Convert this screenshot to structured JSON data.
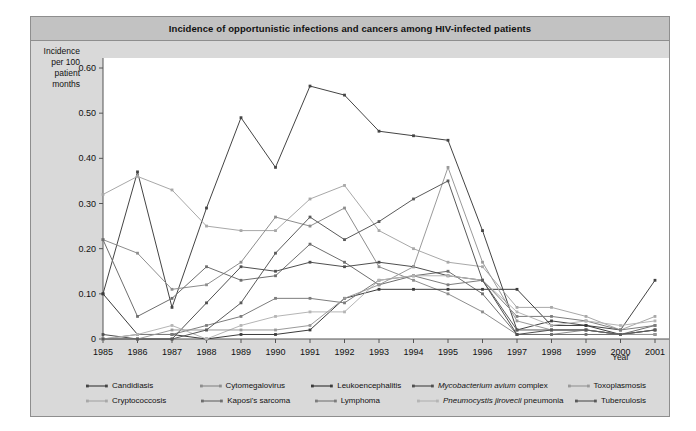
{
  "figure": {
    "title": "Incidence of opportunistic infections and cancers among HIV-infected patients",
    "ylabel_lines": [
      "Incidence",
      "per 100",
      "patient",
      "months"
    ],
    "xlabel": "Year",
    "panel_bg": "#d9d9d9",
    "title_bg": "#c2c2c2",
    "plot_bg": "#ffffff"
  },
  "chart_data": {
    "type": "line",
    "title": "Incidence of opportunistic infections and cancers among HIV-infected patients",
    "xlabel": "Year",
    "ylabel": "Incidence per 100 patient months",
    "x": [
      1985,
      1986,
      1987,
      1988,
      1989,
      1990,
      1991,
      1992,
      1993,
      1994,
      1995,
      1996,
      1997,
      1998,
      1999,
      2000,
      2001
    ],
    "xtick_labels": [
      "1985",
      "1986",
      "1987",
      "1988",
      "1989",
      "1990",
      "1991",
      "1992",
      "1993",
      "1994",
      "1995",
      "1996",
      "1997",
      "1998",
      "1999",
      "2000",
      "2001"
    ],
    "ylim": [
      0,
      0.6
    ],
    "ytick_values": [
      0,
      0.1,
      0.2,
      0.3,
      0.4,
      0.5,
      0.6
    ],
    "ytick_labels": [
      "0",
      "0.10",
      "0.20",
      "0.30",
      "0.40",
      "0.50",
      "0.60"
    ],
    "grid": false,
    "legend_position": "bottom",
    "series": [
      {
        "name": "Candidiasis",
        "color": "#444444",
        "values": [
          0.1,
          0.37,
          0.07,
          0.29,
          0.49,
          0.38,
          0.56,
          0.54,
          0.46,
          0.45,
          0.44,
          0.24,
          0.02,
          0.04,
          0.03,
          0.02,
          0.13
        ]
      },
      {
        "name": "Cryptococcosis",
        "color": "#a8a8a8",
        "values": [
          0.32,
          0.36,
          0.33,
          0.25,
          0.24,
          0.24,
          0.31,
          0.34,
          0.24,
          0.2,
          0.17,
          0.16,
          0.07,
          0.07,
          0.05,
          0.02,
          0.05
        ]
      },
      {
        "name": "Cytomegalovirus",
        "color": "#8d8d8d",
        "values": [
          0.22,
          0.19,
          0.11,
          0.12,
          0.17,
          0.27,
          0.25,
          0.29,
          0.16,
          0.13,
          0.1,
          0.06,
          0.01,
          0.01,
          0.02,
          0.01,
          0.02
        ]
      },
      {
        "name": "Kaposi's sarcoma",
        "color": "#6e6e6e",
        "values": [
          0.22,
          0.05,
          0.09,
          0.16,
          0.13,
          0.14,
          0.21,
          0.17,
          0.12,
          0.14,
          0.15,
          0.1,
          0.01,
          0.01,
          0.01,
          0.01,
          0.03
        ]
      },
      {
        "name": "Leukoencephalitis",
        "color": "#3b3b3b",
        "values": [
          0.1,
          0.01,
          0.01,
          0.0,
          0.01,
          0.01,
          0.02,
          0.09,
          0.11,
          0.11,
          0.11,
          0.11,
          0.11,
          0.03,
          0.03,
          0.01,
          0.01
        ]
      },
      {
        "name": "Lymphoma",
        "color": "#7d7d7d",
        "values": [
          0.0,
          0.01,
          0.01,
          0.03,
          0.05,
          0.09,
          0.09,
          0.08,
          0.13,
          0.14,
          0.12,
          0.13,
          0.05,
          0.05,
          0.04,
          0.02,
          0.03
        ]
      },
      {
        "name": "Mycobacterium avium complex",
        "color": "#4f4f4f",
        "values": [
          0.01,
          0.0,
          0.0,
          0.08,
          0.16,
          0.15,
          0.17,
          0.16,
          0.17,
          0.16,
          0.14,
          0.13,
          0.01,
          0.02,
          0.02,
          0.01,
          0.02
        ]
      },
      {
        "name": "Pneumocystis jirovecii pneumonia",
        "color": "#b5b5b5",
        "values": [
          0.0,
          0.01,
          0.03,
          0.0,
          0.03,
          0.05,
          0.06,
          0.06,
          0.13,
          0.14,
          0.14,
          0.13,
          0.06,
          0.03,
          0.04,
          0.03,
          0.04
        ]
      },
      {
        "name": "Toxoplasmosis",
        "color": "#9a9a9a",
        "values": [
          0.0,
          0.0,
          0.02,
          0.02,
          0.02,
          0.02,
          0.03,
          0.09,
          0.12,
          0.16,
          0.38,
          0.17,
          0.04,
          0.02,
          0.02,
          0.01,
          0.01
        ]
      },
      {
        "name": "Tuberculosis",
        "color": "#5a5a5a",
        "values": [
          0.0,
          0.0,
          0.0,
          0.02,
          0.08,
          0.19,
          0.27,
          0.22,
          0.26,
          0.31,
          0.35,
          0.13,
          0.02,
          0.02,
          0.02,
          0.01,
          0.02
        ]
      }
    ]
  },
  "legend": {
    "rows": [
      [
        {
          "label": "Candidiasis",
          "italic": "",
          "color": "#444444"
        },
        {
          "label": "Cytomegalovirus",
          "italic": "",
          "color": "#8d8d8d"
        },
        {
          "label": "Leukoencephalitis",
          "italic": "",
          "color": "#3b3b3b"
        },
        {
          "label": " complex",
          "italic": "Mycobacterium avium",
          "color": "#4f4f4f"
        },
        {
          "label": "Toxoplasmosis",
          "italic": "",
          "color": "#9a9a9a"
        }
      ],
      [
        {
          "label": "Cryptococcosis",
          "italic": "",
          "color": "#a8a8a8"
        },
        {
          "label": "Kaposi's sarcoma",
          "italic": "",
          "color": "#6e6e6e"
        },
        {
          "label": "Lymphoma",
          "italic": "",
          "color": "#7d7d7d"
        },
        {
          "label": " pneumonia",
          "italic": "Pneumocystis jirovecii",
          "color": "#b5b5b5"
        },
        {
          "label": "Tuberculosis",
          "italic": "",
          "color": "#5a5a5a"
        }
      ]
    ]
  }
}
